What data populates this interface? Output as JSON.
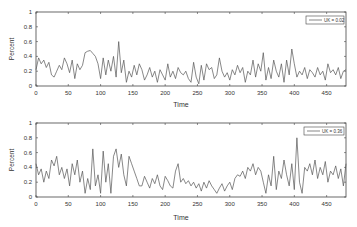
{
  "chart_data": [
    {
      "type": "line",
      "title": "",
      "xlabel": "Time",
      "ylabel": "Percent",
      "xlim": [
        0,
        480
      ],
      "ylim": [
        0,
        1
      ],
      "xticks": [
        0,
        50,
        100,
        150,
        200,
        250,
        300,
        350,
        400,
        450
      ],
      "yticks": [
        0,
        0.2,
        0.4,
        0.6,
        0.8,
        1
      ],
      "ytick_labels": [
        "0",
        "0.2",
        "0.4",
        "0.6",
        "0.8",
        "1"
      ],
      "grid": false,
      "legend_position": "upper right",
      "series": [
        {
          "name": "UK = 0.02",
          "x_step": 4,
          "values": [
            0.22,
            0.38,
            0.3,
            0.35,
            0.25,
            0.32,
            0.15,
            0.12,
            0.2,
            0.28,
            0.22,
            0.38,
            0.3,
            0.18,
            0.35,
            0.1,
            0.3,
            0.22,
            0.28,
            0.45,
            0.47,
            0.48,
            0.44,
            0.4,
            0.3,
            0.1,
            0.38,
            0.15,
            0.35,
            0.2,
            0.4,
            0.12,
            0.6,
            0.18,
            0.35,
            0.05,
            0.2,
            0.12,
            0.28,
            0.15,
            0.3,
            0.22,
            0.08,
            0.15,
            0.25,
            0.12,
            0.2,
            0.05,
            0.22,
            0.15,
            0.08,
            0.3,
            0.12,
            0.2,
            0.1,
            0.25,
            0.18,
            0.15,
            0.2,
            0.1,
            0.05,
            0.32,
            0.12,
            0.03,
            0.28,
            0.08,
            0.3,
            0.22,
            0.25,
            0.1,
            0.15,
            0.38,
            0.2,
            0.12,
            0.18,
            0.08,
            0.22,
            0.15,
            0.28,
            0.18,
            0.25,
            0.05,
            0.2,
            0.15,
            0.35,
            0.12,
            0.3,
            0.2,
            0.45,
            0.08,
            0.25,
            0.1,
            0.35,
            0.2,
            0.12,
            0.3,
            0.05,
            0.35,
            0.15,
            0.5,
            0.3,
            0.12,
            0.2,
            0.15,
            0.25,
            0.1,
            0.22,
            0.18,
            0.12,
            0.25,
            0.15,
            0.2,
            0.08,
            0.3,
            0.18,
            0.22,
            0.15,
            0.25,
            0.1,
            0.2,
            0.22
          ]
        }
      ]
    },
    {
      "type": "line",
      "title": "",
      "xlabel": "Time",
      "ylabel": "Percent",
      "xlim": [
        0,
        480
      ],
      "ylim": [
        0,
        1
      ],
      "xticks": [
        0,
        50,
        100,
        150,
        200,
        250,
        300,
        350,
        400,
        450
      ],
      "yticks": [
        0,
        0.2,
        0.4,
        0.6,
        0.8,
        1
      ],
      "ytick_labels": [
        "0",
        "0.2",
        "0.4",
        "0.6",
        "0.8",
        "1"
      ],
      "grid": false,
      "legend_position": "upper right",
      "series": [
        {
          "name": "UK = 0.36",
          "x_step": 4,
          "values": [
            0.45,
            0.3,
            0.38,
            0.2,
            0.35,
            0.25,
            0.5,
            0.42,
            0.55,
            0.3,
            0.4,
            0.25,
            0.38,
            0.15,
            0.45,
            0.3,
            0.5,
            0.2,
            0.35,
            0.05,
            0.25,
            0.1,
            0.65,
            0.15,
            0.3,
            0.05,
            0.62,
            0.2,
            0.45,
            0.05,
            0.55,
            0.65,
            0.4,
            0.58,
            0.3,
            0.15,
            0.55,
            0.45,
            0.35,
            0.25,
            0.15,
            0.15,
            0.28,
            0.2,
            0.12,
            0.25,
            0.18,
            0.3,
            0.15,
            0.1,
            0.28,
            0.22,
            0.15,
            0.12,
            0.35,
            0.45,
            0.2,
            0.25,
            0.18,
            0.22,
            0.15,
            0.2,
            0.12,
            0.18,
            0.08,
            0.2,
            0.12,
            0.22,
            0.15,
            0.1,
            0.05,
            0.12,
            0.18,
            0.08,
            0.15,
            0.2,
            0.1,
            0.25,
            0.3,
            0.28,
            0.35,
            0.25,
            0.4,
            0.35,
            0.45,
            0.3,
            0.4,
            0.35,
            0.2,
            0.05,
            0.3,
            0.15,
            0.55,
            0.1,
            0.35,
            0.25,
            0.5,
            0.3,
            0.15,
            0.45,
            0.1,
            0.8,
            0.2,
            0.05,
            0.4,
            0.35,
            0.45,
            0.3,
            0.5,
            0.25,
            0.4,
            0.3,
            0.48,
            0.2,
            0.35,
            0.3,
            0.42,
            0.25,
            0.38,
            0.15,
            0.45
          ]
        }
      ]
    }
  ],
  "plots": [
    {
      "legend_label": "UK = 0.02",
      "xlabel": "Time",
      "ylabel": "Percent"
    },
    {
      "legend_label": "UK = 0.36",
      "xlabel": "Time",
      "ylabel": "Percent"
    }
  ],
  "colors": {
    "line": "#555555",
    "axis": "#444444",
    "text": "#333333"
  }
}
